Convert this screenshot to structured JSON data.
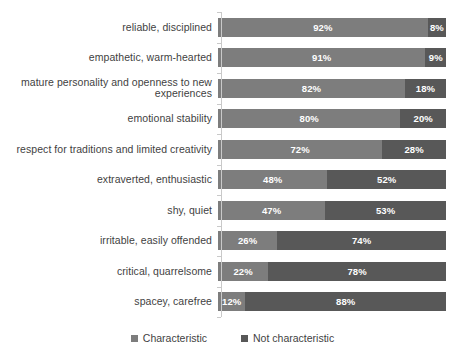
{
  "chart_data": {
    "type": "bar",
    "subtype": "stacked-horizontal-100pct",
    "title": "",
    "subtitle": "",
    "xlabel": "",
    "ylabel": "",
    "xlim": [
      0,
      100
    ],
    "grid": false,
    "legend_position": "bottom-center",
    "categories": [
      "reliable, disciplined",
      "empathetic, warm-hearted",
      "mature personality and openness to new\nexperiences",
      "emotional stability",
      "respect for traditions and limited creativity",
      "extraverted, enthusiastic",
      "shy, quiet",
      "irritable, easily offended",
      "critical, quarrelsome",
      "spacey, carefree"
    ],
    "series": [
      {
        "name": "Characteristic",
        "color": "#7d7d7d",
        "values": [
          92,
          91,
          82,
          80,
          72,
          48,
          47,
          26,
          22,
          12
        ],
        "labels": [
          "92%",
          "91%",
          "82%",
          "80%",
          "72%",
          "48%",
          "47%",
          "26%",
          "22%",
          "12%"
        ]
      },
      {
        "name": "Not characteristic",
        "color": "#585858",
        "values": [
          8,
          9,
          18,
          20,
          28,
          52,
          53,
          74,
          78,
          88
        ],
        "labels": [
          "8%",
          "9%",
          "18%",
          "20%",
          "28%",
          "52%",
          "53%",
          "74%",
          "78%",
          "88%"
        ]
      }
    ]
  },
  "legend": {
    "items": [
      {
        "label": "Characteristic",
        "color": "#7d7d7d"
      },
      {
        "label": "Not characteristic",
        "color": "#585858"
      }
    ]
  }
}
